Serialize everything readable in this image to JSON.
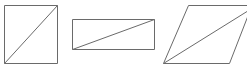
{
  "diagram": {
    "stroke_color": "#6a6a6a",
    "background": "#ffffff",
    "shapes": [
      {
        "name": "square",
        "points": [
          [
            4.5,
            5.5
          ],
          [
            57.5,
            5.5
          ],
          [
            57.5,
            63.5
          ],
          [
            4.5,
            63.5
          ]
        ],
        "diagonal": [
          [
            4.5,
            63.5
          ],
          [
            57.5,
            5.5
          ]
        ]
      },
      {
        "name": "rectangle",
        "points": [
          [
            72.5,
            19.5
          ],
          [
            154.5,
            19.5
          ],
          [
            154.5,
            49.5
          ],
          [
            72.5,
            49.5
          ]
        ],
        "diagonal": [
          [
            72.5,
            49.5
          ],
          [
            154.5,
            19.5
          ]
        ]
      },
      {
        "name": "parallelogram",
        "points": [
          [
            188.5,
            5.5
          ],
          [
            252,
            5.5
          ],
          [
            229.5,
            63.5
          ],
          [
            163.5,
            63.5
          ]
        ],
        "diagonal": [
          [
            163.5,
            63.5
          ],
          [
            247,
            11.5
          ]
        ]
      }
    ]
  }
}
